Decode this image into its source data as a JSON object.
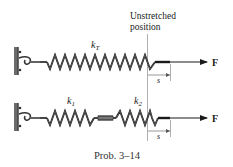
{
  "diagram": {
    "type": "spring-system",
    "caption": "Prob. 3–14",
    "reference_label_line1": "Unstretched",
    "reference_label_line2": "position",
    "top_system": {
      "spring_label": "k",
      "spring_subscript": "T",
      "displacement_label": "s",
      "force_label": "F"
    },
    "bottom_system": {
      "spring1_label": "k",
      "spring1_subscript": "1",
      "spring2_label": "k",
      "spring2_subscript": "2",
      "displacement_label": "s",
      "force_label": "F"
    },
    "colors": {
      "ink": "#1a1a1a",
      "wall": "#6b6b6b",
      "guide_line": "#9a9a9a",
      "spring_highlight": "#8a8a8a"
    }
  }
}
